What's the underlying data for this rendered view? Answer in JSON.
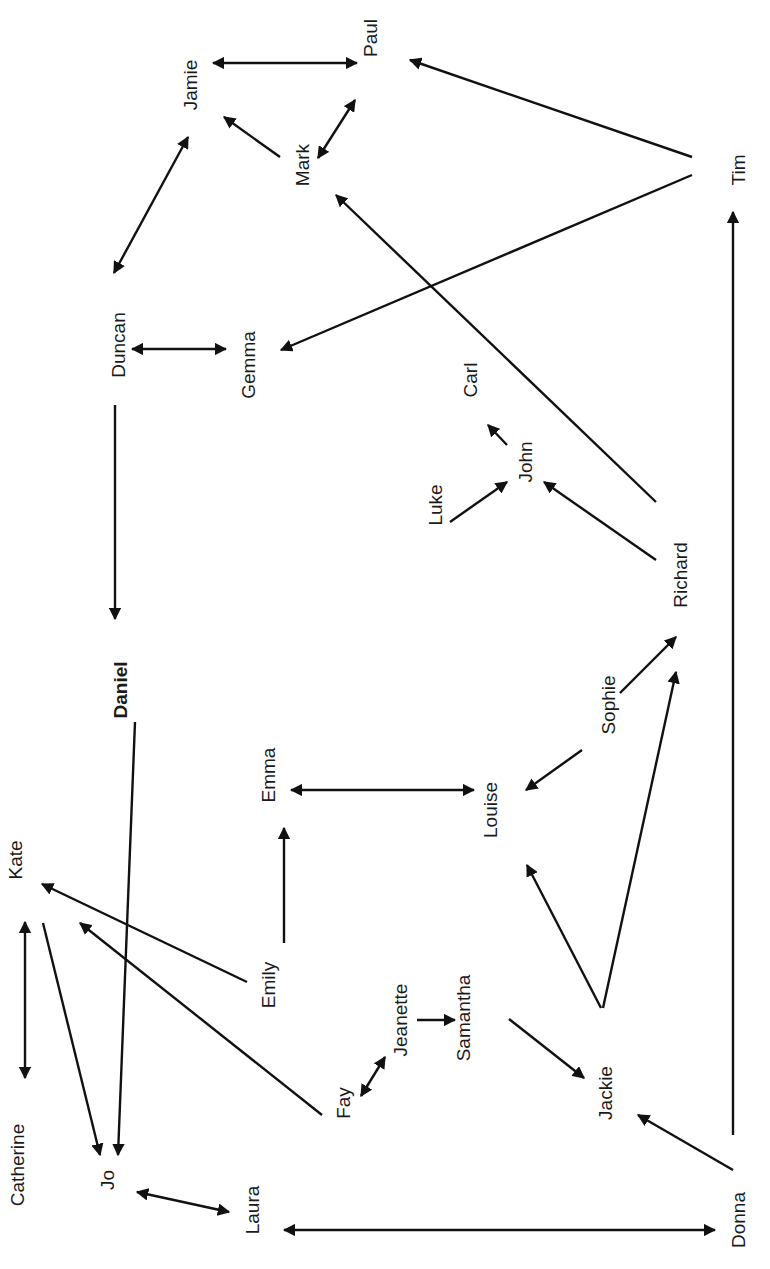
{
  "diagram": {
    "type": "directed-network",
    "orientation": "rotated-90-ccw",
    "colors": {
      "line": "#111111",
      "text": "#1a1a1a",
      "background": "#ffffff"
    },
    "nodes": [
      {
        "id": "paul",
        "label": "Paul",
        "x": 370,
        "y": 38,
        "bold": false
      },
      {
        "id": "jamie",
        "label": "Jamie",
        "x": 190,
        "y": 85,
        "bold": false
      },
      {
        "id": "mark",
        "label": "Mark",
        "x": 302,
        "y": 165,
        "bold": false
      },
      {
        "id": "tim",
        "label": "Tim",
        "x": 738,
        "y": 170,
        "bold": false
      },
      {
        "id": "duncan",
        "label": "Duncan",
        "x": 118,
        "y": 345,
        "bold": false
      },
      {
        "id": "gemma",
        "label": "Gemma",
        "x": 248,
        "y": 365,
        "bold": false
      },
      {
        "id": "carl",
        "label": "Carl",
        "x": 470,
        "y": 380,
        "bold": false
      },
      {
        "id": "john",
        "label": "John",
        "x": 525,
        "y": 462,
        "bold": false
      },
      {
        "id": "luke",
        "label": "Luke",
        "x": 435,
        "y": 505,
        "bold": false
      },
      {
        "id": "richard",
        "label": "Richard",
        "x": 680,
        "y": 575,
        "bold": false
      },
      {
        "id": "daniel",
        "label": "Daniel",
        "x": 120,
        "y": 690,
        "bold": true
      },
      {
        "id": "sophie",
        "label": "Sophie",
        "x": 608,
        "y": 705,
        "bold": false
      },
      {
        "id": "emma",
        "label": "Emma",
        "x": 268,
        "y": 775,
        "bold": false
      },
      {
        "id": "louise",
        "label": "Louise",
        "x": 490,
        "y": 810,
        "bold": false
      },
      {
        "id": "kate",
        "label": "Kate",
        "x": 15,
        "y": 860,
        "bold": false
      },
      {
        "id": "emily",
        "label": "Emily",
        "x": 268,
        "y": 985,
        "bold": false
      },
      {
        "id": "jeanette",
        "label": "Jeanette",
        "x": 400,
        "y": 1020,
        "bold": false
      },
      {
        "id": "samantha",
        "label": "Samantha",
        "x": 463,
        "y": 1018,
        "bold": false
      },
      {
        "id": "fay",
        "label": "Fay",
        "x": 343,
        "y": 1103,
        "bold": false
      },
      {
        "id": "jackie",
        "label": "Jackie",
        "x": 605,
        "y": 1093,
        "bold": false
      },
      {
        "id": "catherine",
        "label": "Catherine",
        "x": 17,
        "y": 1165,
        "bold": false
      },
      {
        "id": "jo",
        "label": "Jo",
        "x": 107,
        "y": 1180,
        "bold": false
      },
      {
        "id": "laura",
        "label": "Laura",
        "x": 252,
        "y": 1210,
        "bold": false
      },
      {
        "id": "donna",
        "label": "Donna",
        "x": 738,
        "y": 1220,
        "bold": false
      }
    ],
    "edges": [
      {
        "from": "jamie",
        "to": "paul",
        "x1": 213,
        "y1": 63,
        "x2": 357,
        "y2": 63,
        "bidirectional": true
      },
      {
        "from": "tim",
        "to": "paul",
        "x1": 692,
        "y1": 157,
        "x2": 410,
        "y2": 60,
        "bidirectional": false
      },
      {
        "from": "mark",
        "to": "paul",
        "x1": 318,
        "y1": 158,
        "x2": 355,
        "y2": 100,
        "bidirectional": true
      },
      {
        "from": "mark",
        "to": "jamie",
        "x1": 280,
        "y1": 157,
        "x2": 224,
        "y2": 117,
        "bidirectional": false
      },
      {
        "from": "jamie",
        "to": "duncan",
        "x1": 188,
        "y1": 137,
        "x2": 114,
        "y2": 273,
        "bidirectional": true
      },
      {
        "from": "tim",
        "to": "gemma",
        "x1": 692,
        "y1": 175,
        "x2": 281,
        "y2": 350,
        "bidirectional": false
      },
      {
        "from": "duncan",
        "to": "gemma",
        "x1": 132,
        "y1": 349,
        "x2": 226,
        "y2": 349,
        "bidirectional": true
      },
      {
        "from": "richard",
        "to": "mark",
        "x1": 656,
        "y1": 502,
        "x2": 336,
        "y2": 195,
        "bidirectional": false
      },
      {
        "from": "duncan",
        "to": "daniel",
        "x1": 115,
        "y1": 405,
        "x2": 115,
        "y2": 619,
        "bidirectional": false
      },
      {
        "from": "john",
        "to": "carl",
        "x1": 507,
        "y1": 445,
        "x2": 488,
        "y2": 425,
        "bidirectional": false
      },
      {
        "from": "luke",
        "to": "john",
        "x1": 450,
        "y1": 522,
        "x2": 507,
        "y2": 482,
        "bidirectional": false
      },
      {
        "from": "richard",
        "to": "john",
        "x1": 656,
        "y1": 560,
        "x2": 544,
        "y2": 482,
        "bidirectional": false
      },
      {
        "from": "sophie",
        "to": "richard",
        "x1": 620,
        "y1": 693,
        "x2": 676,
        "y2": 637,
        "bidirectional": false
      },
      {
        "from": "sophie",
        "to": "louise",
        "x1": 582,
        "y1": 750,
        "x2": 526,
        "y2": 790,
        "bidirectional": false
      },
      {
        "from": "emma",
        "to": "louise",
        "x1": 291,
        "y1": 790,
        "x2": 474,
        "y2": 790,
        "bidirectional": true
      },
      {
        "from": "jackie",
        "to": "richard",
        "x1": 603,
        "y1": 1008,
        "x2": 676,
        "y2": 672,
        "bidirectional": false
      },
      {
        "from": "jackie",
        "to": "louise",
        "x1": 601,
        "y1": 1008,
        "x2": 527,
        "y2": 865,
        "bidirectional": false
      },
      {
        "from": "emily",
        "to": "emma",
        "x1": 284,
        "y1": 943,
        "x2": 284,
        "y2": 828,
        "bidirectional": false
      },
      {
        "from": "daniel",
        "to": "jo",
        "x1": 135,
        "y1": 722,
        "x2": 118,
        "y2": 1155,
        "bidirectional": false
      },
      {
        "from": "emily",
        "to": "kate",
        "x1": 247,
        "y1": 982,
        "x2": 42,
        "y2": 884,
        "bidirectional": false
      },
      {
        "from": "fay",
        "to": "kate",
        "x1": 322,
        "y1": 1115,
        "x2": 80,
        "y2": 923,
        "bidirectional": false
      },
      {
        "from": "kate",
        "to": "jo",
        "x1": 43,
        "y1": 923,
        "x2": 100,
        "y2": 1155,
        "bidirectional": false
      },
      {
        "from": "catherine",
        "to": "kate",
        "x1": 25,
        "y1": 922,
        "x2": 25,
        "y2": 1078,
        "bidirectional": true
      },
      {
        "from": "fay",
        "to": "jeanette",
        "x1": 361,
        "y1": 1096,
        "x2": 385,
        "y2": 1057,
        "bidirectional": true
      },
      {
        "from": "jeanette",
        "to": "samantha",
        "x1": 417,
        "y1": 1020,
        "x2": 455,
        "y2": 1020,
        "bidirectional": false
      },
      {
        "from": "samantha",
        "to": "jackie",
        "x1": 509,
        "y1": 1019,
        "x2": 584,
        "y2": 1078,
        "bidirectional": false
      },
      {
        "from": "donna",
        "to": "jackie",
        "x1": 733,
        "y1": 1170,
        "x2": 638,
        "y2": 1115,
        "bidirectional": false
      },
      {
        "from": "donna",
        "to": "tim",
        "x1": 733,
        "y1": 1135,
        "x2": 733,
        "y2": 212,
        "bidirectional": false
      },
      {
        "from": "jo",
        "to": "laura",
        "x1": 137,
        "y1": 1192,
        "x2": 229,
        "y2": 1212,
        "bidirectional": true
      },
      {
        "from": "laura",
        "to": "donna",
        "x1": 284,
        "y1": 1230,
        "x2": 715,
        "y2": 1230,
        "bidirectional": true
      }
    ]
  }
}
